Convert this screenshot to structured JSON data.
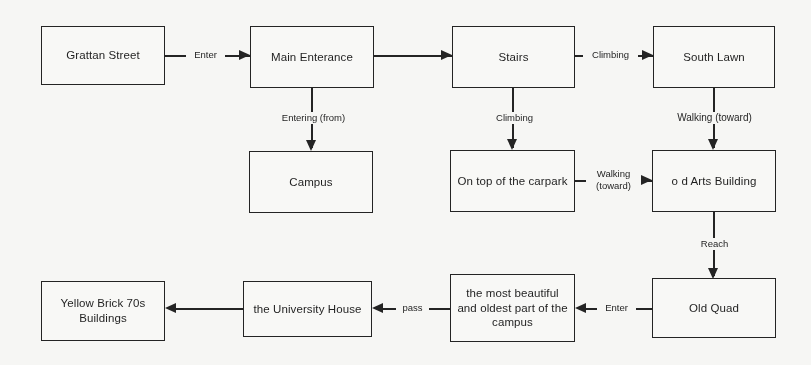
{
  "diagram": {
    "type": "flowchart",
    "background_color": "#fbfbf9",
    "line_color": "#1b1b1b",
    "nodes": [
      {
        "id": "grattan-street",
        "label": "Grattan Street"
      },
      {
        "id": "main-enterance",
        "label": "Main Enterance"
      },
      {
        "id": "stairs",
        "label": "Stairs"
      },
      {
        "id": "south-lawn",
        "label": "South Lawn"
      },
      {
        "id": "campus",
        "label": "Campus"
      },
      {
        "id": "on-top-of-carpark",
        "label": "On top of the carpark"
      },
      {
        "id": "old-arts-building",
        "label": "o d Arts Building"
      },
      {
        "id": "old-quad",
        "label": "Old Quad"
      },
      {
        "id": "most-beautiful-part",
        "label": "the most beautiful\nand oldest part of the\ncampus"
      },
      {
        "id": "university-house",
        "label": "the University House"
      },
      {
        "id": "yellow-brick",
        "label": "Yellow Brick 70s\nBuildings"
      }
    ],
    "edges": [
      {
        "id": "grattan-to-main",
        "from": "grattan-street",
        "to": "main-enterance",
        "label": "Enter",
        "direction": "right"
      },
      {
        "id": "main-to-stairs",
        "from": "main-enterance",
        "to": "stairs",
        "label": "",
        "direction": "right"
      },
      {
        "id": "stairs-to-southlawn",
        "from": "stairs",
        "to": "south-lawn",
        "label": "Climbing",
        "direction": "right"
      },
      {
        "id": "main-to-campus",
        "from": "main-enterance",
        "to": "campus",
        "label": "Entering (from)",
        "direction": "down"
      },
      {
        "id": "stairs-to-carpark",
        "from": "stairs",
        "to": "on-top-of-carpark",
        "label": "Climbing",
        "direction": "down"
      },
      {
        "id": "southlawn-to-arts",
        "from": "south-lawn",
        "to": "old-arts-building",
        "label": "Walking (toward)",
        "direction": "down"
      },
      {
        "id": "carpark-to-arts",
        "from": "on-top-of-carpark",
        "to": "old-arts-building",
        "label": "Walking\n(toward)",
        "direction": "right"
      },
      {
        "id": "arts-to-oldquad",
        "from": "old-arts-building",
        "to": "old-quad",
        "label": "Reach",
        "direction": "down"
      },
      {
        "id": "oldquad-to-beautiful",
        "from": "old-quad",
        "to": "most-beautiful-part",
        "label": "Enter",
        "direction": "left"
      },
      {
        "id": "beautiful-to-unihouse",
        "from": "most-beautiful-part",
        "to": "university-house",
        "label": "pass",
        "direction": "left"
      },
      {
        "id": "unihouse-to-yellow",
        "from": "university-house",
        "to": "yellow-brick",
        "label": "",
        "direction": "left"
      }
    ]
  }
}
